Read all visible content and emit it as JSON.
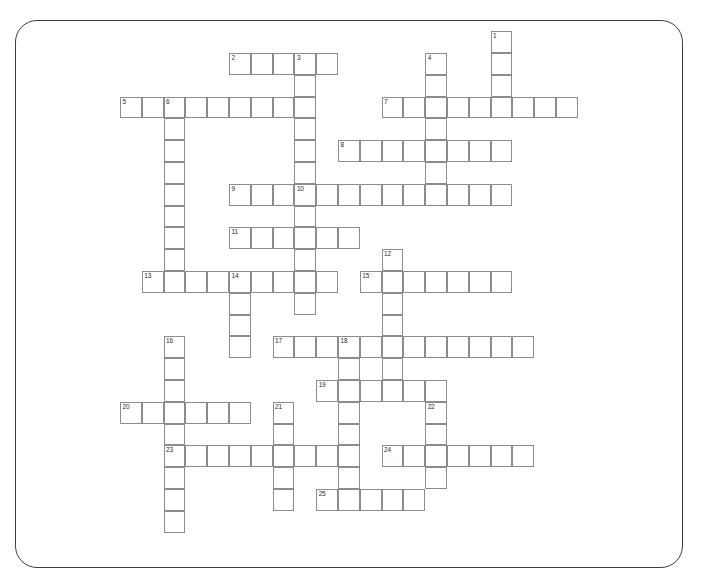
{
  "panel": {
    "border_color": "#3c3f41",
    "background": "#ffffff",
    "corner_radius": 22
  },
  "grid": {
    "cell_size": 21.8,
    "origin_x": 120.0,
    "origin_y": 53.0,
    "cell_border_color": "#8c8c8c",
    "cell_fill": "#ffffff",
    "number_color": "#2b2b2b",
    "columns": 26,
    "rows": 22
  },
  "entries": [
    {
      "number": "1",
      "direction": "down",
      "col": 17,
      "row": -1,
      "length": 4
    },
    {
      "number": "2",
      "direction": "across",
      "col": 5,
      "row": 0,
      "length": 5
    },
    {
      "number": "3",
      "direction": "down",
      "col": 8,
      "row": 0,
      "length": 9
    },
    {
      "number": "4",
      "direction": "down",
      "col": 14,
      "row": 0,
      "length": 7
    },
    {
      "number": "5",
      "direction": "across",
      "col": 0,
      "row": 2,
      "length": 8
    },
    {
      "number": "6",
      "direction": "down",
      "col": 2,
      "row": 2,
      "length": 9
    },
    {
      "number": "7",
      "direction": "across",
      "col": 12,
      "row": 2,
      "length": 9
    },
    {
      "number": "8",
      "direction": "across",
      "col": 10,
      "row": 4,
      "length": 8
    },
    {
      "number": "9",
      "direction": "across",
      "col": 5,
      "row": 6,
      "length": 13
    },
    {
      "number": "10",
      "direction": "down",
      "col": 8,
      "row": 6,
      "length": 6
    },
    {
      "number": "11",
      "direction": "across",
      "col": 5,
      "row": 8,
      "length": 6
    },
    {
      "number": "12",
      "direction": "down",
      "col": 12,
      "row": 9,
      "length": 7
    },
    {
      "number": "13",
      "direction": "across",
      "col": 1,
      "row": 10,
      "length": 9
    },
    {
      "number": "14",
      "direction": "down",
      "col": 5,
      "row": 10,
      "length": 4
    },
    {
      "number": "15",
      "direction": "across",
      "col": 11,
      "row": 10,
      "length": 7
    },
    {
      "number": "16",
      "direction": "down",
      "col": 2,
      "row": 13,
      "length": 9
    },
    {
      "number": "17",
      "direction": "across",
      "col": 7,
      "row": 13,
      "length": 12
    },
    {
      "number": "18",
      "direction": "down",
      "col": 10,
      "row": 13,
      "length": 7
    },
    {
      "number": "19",
      "direction": "across",
      "col": 9,
      "row": 15,
      "length": 6
    },
    {
      "number": "20",
      "direction": "across",
      "col": 0,
      "row": 16,
      "length": 6
    },
    {
      "number": "21",
      "direction": "down",
      "col": 7,
      "row": 16,
      "length": 5
    },
    {
      "number": "22",
      "direction": "down",
      "col": 14,
      "row": 16,
      "length": 4
    },
    {
      "number": "23",
      "direction": "across",
      "col": 2,
      "row": 18,
      "length": 9
    },
    {
      "number": "24",
      "direction": "across",
      "col": 12,
      "row": 18,
      "length": 7
    },
    {
      "number": "25",
      "direction": "across",
      "col": 9,
      "row": 20,
      "length": 5
    }
  ]
}
